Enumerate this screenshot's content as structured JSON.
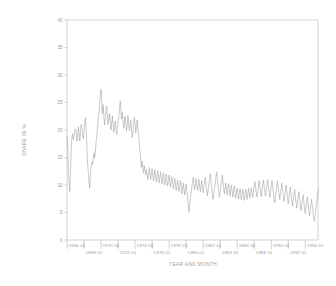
{
  "chart_data": {
    "type": "line",
    "title": "",
    "xlabel": "YEAR AND MONTH",
    "ylabel": "SHARE IN %",
    "ylim": [
      0,
      40
    ],
    "yticks": [
      0,
      5,
      10,
      15,
      20,
      25,
      30,
      35,
      40
    ],
    "ytick_labels": [
      "0",
      "5",
      "10",
      "15",
      "20",
      "25",
      "30",
      "35",
      "40"
    ],
    "grid": false,
    "legend": null,
    "xtick_labels_upper": [
      "1966 01",
      "1970 01",
      "1974 01",
      "1978 01",
      "1982 01",
      "1986 01",
      "1990 01",
      "1994 01"
    ],
    "xtick_labels_lower": [
      "1968 01",
      "1972 01",
      "1976 01",
      "1980 01",
      "1984 01",
      "1988 01",
      "1992 01"
    ],
    "xtick_years_upper": [
      1966,
      1970,
      1974,
      1978,
      1982,
      1986,
      1990,
      1994
    ],
    "xtick_years_lower": [
      1968,
      1972,
      1976,
      1980,
      1984,
      1988,
      1992
    ],
    "xlim_years": [
      1966,
      1995.5
    ],
    "x_start_year": 1966,
    "x_start_month": 1,
    "frequency": "monthly",
    "series": [
      {
        "name": "share",
        "values": [
          18.8,
          17.2,
          12.0,
          10.4,
          8.8,
          13.0,
          16.6,
          18.9,
          19.3,
          18.2,
          19.0,
          20.0,
          20.2,
          19.5,
          17.9,
          18.6,
          20.6,
          19.3,
          18.0,
          19.5,
          21.0,
          20.3,
          19.1,
          18.4,
          19.6,
          21.4,
          22.2,
          20.1,
          17.0,
          14.2,
          12.3,
          10.7,
          9.4,
          11.6,
          13.2,
          14.1,
          13.8,
          14.6,
          15.9,
          14.9,
          16.0,
          17.8,
          19.0,
          20.4,
          21.9,
          23.1,
          24.6,
          26.1,
          27.4,
          25.2,
          23.0,
          24.6,
          22.4,
          20.9,
          22.1,
          23.8,
          24.4,
          22.6,
          21.0,
          22.2,
          23.0,
          21.4,
          20.0,
          21.2,
          22.6,
          21.0,
          19.6,
          20.5,
          21.6,
          20.4,
          19.2,
          20.2,
          21.2,
          22.4,
          23.8,
          25.3,
          23.6,
          22.0,
          23.2,
          21.6,
          20.3,
          21.4,
          22.5,
          21.0,
          19.8,
          21.0,
          22.6,
          21.2,
          19.9,
          20.8,
          21.8,
          20.2,
          18.6,
          19.8,
          21.2,
          22.3,
          21.0,
          19.5,
          20.6,
          21.8,
          20.2,
          18.9,
          17.4,
          16.0,
          14.6,
          13.2,
          14.4,
          13.0,
          12.2,
          13.5,
          12.6,
          11.8,
          12.8,
          11.9,
          11.0,
          12.1,
          13.2,
          12.0,
          11.0,
          12.2,
          13.0,
          11.8,
          10.8,
          11.9,
          12.8,
          11.6,
          10.6,
          11.6,
          12.6,
          11.4,
          10.4,
          11.4,
          12.4,
          11.2,
          10.2,
          11.2,
          12.2,
          11.0,
          10.0,
          11.0,
          12.0,
          10.8,
          9.8,
          10.8,
          11.8,
          10.6,
          9.6,
          10.6,
          11.5,
          10.3,
          9.3,
          10.2,
          11.2,
          10.0,
          9.0,
          10.0,
          10.9,
          9.7,
          8.8,
          9.8,
          10.8,
          9.5,
          8.4,
          9.4,
          10.4,
          9.2,
          8.2,
          9.2,
          10.2,
          9.0,
          7.8,
          6.6,
          5.0,
          6.4,
          7.6,
          8.6,
          9.6,
          10.6,
          11.4,
          10.2,
          9.2,
          10.2,
          11.2,
          10.0,
          9.0,
          10.0,
          11.0,
          9.8,
          8.8,
          9.8,
          10.8,
          9.6,
          8.6,
          9.6,
          10.6,
          11.4,
          10.2,
          9.0,
          8.0,
          9.0,
          10.0,
          11.0,
          12.0,
          10.8,
          9.6,
          8.4,
          7.4,
          8.4,
          9.4,
          10.4,
          11.4,
          12.4,
          11.2,
          10.0,
          8.8,
          7.8,
          8.8,
          9.8,
          10.8,
          11.8,
          10.6,
          9.4,
          8.4,
          9.4,
          10.4,
          9.2,
          8.2,
          9.2,
          10.2,
          9.0,
          8.0,
          9.0,
          10.0,
          8.8,
          7.8,
          8.8,
          9.8,
          8.6,
          7.6,
          8.6,
          9.4,
          8.4,
          7.4,
          8.4,
          9.3,
          8.3,
          7.3,
          8.3,
          9.2,
          8.2,
          7.2,
          8.2,
          9.2,
          8.3,
          7.4,
          8.4,
          9.4,
          8.5,
          7.6,
          8.6,
          9.5,
          8.6,
          7.8,
          8.8,
          9.8,
          10.6,
          9.6,
          8.6,
          7.8,
          8.8,
          9.8,
          10.8,
          9.8,
          8.8,
          7.9,
          8.9,
          9.9,
          10.9,
          9.9,
          8.9,
          8.0,
          9.0,
          10.0,
          11.0,
          9.9,
          8.8,
          7.8,
          8.8,
          9.8,
          10.8,
          9.8,
          8.6,
          7.6,
          6.8,
          7.8,
          8.8,
          9.8,
          10.8,
          9.6,
          8.4,
          7.4,
          8.4,
          9.4,
          10.4,
          9.2,
          8.0,
          7.0,
          8.0,
          9.0,
          10.0,
          8.8,
          7.6,
          6.6,
          7.6,
          8.6,
          9.6,
          8.4,
          7.2,
          6.2,
          7.2,
          8.2,
          9.2,
          8.0,
          6.8,
          5.8,
          6.8,
          7.8,
          8.8,
          7.6,
          6.4,
          5.4,
          6.4,
          7.4,
          8.2,
          7.0,
          5.8,
          4.8,
          5.8,
          6.8,
          7.8,
          6.6,
          5.4,
          4.4,
          5.4,
          6.4,
          7.4,
          6.2,
          5.0,
          4.0,
          3.4,
          4.6,
          5.8,
          6.8,
          7.6,
          8.6,
          9.2
        ]
      }
    ]
  },
  "axis": {
    "y_title": "SHARE IN %",
    "x_title": "YEAR AND MONTH"
  }
}
